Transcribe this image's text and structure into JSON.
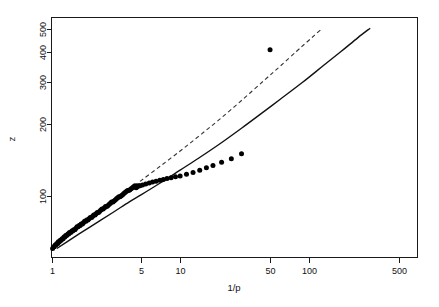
{
  "figure": {
    "background_color": "#ffffff",
    "foreground_color": "#111111",
    "width": 439,
    "height": 307
  },
  "axes": {
    "x_title": "1/p",
    "y_title": "z"
  },
  "chart_data": {
    "type": "scatter",
    "title": "",
    "subtitle": "",
    "xlabel": "1/p",
    "ylabel": "z",
    "xscale": "log",
    "yscale": "log",
    "grid": false,
    "legend": "none",
    "xlim": [
      1.0,
      700
    ],
    "ylim": [
      55,
      560
    ],
    "xticks": [
      1,
      5,
      10,
      50,
      100,
      500
    ],
    "xtick_labels": [
      "1",
      "5",
      "10",
      "50",
      "100",
      "500"
    ],
    "yticks": [
      100,
      200,
      300,
      400,
      500
    ],
    "ytick_labels": [
      "100",
      "200",
      "300",
      "400",
      "500"
    ],
    "series": [
      {
        "name": "observations",
        "type": "scatter",
        "marker": "filled-circle",
        "color": "#000000",
        "points": [
          [
            1.02,
            60
          ],
          [
            1.04,
            61
          ],
          [
            1.05,
            61
          ],
          [
            1.07,
            62
          ],
          [
            1.08,
            62
          ],
          [
            1.1,
            63
          ],
          [
            1.12,
            63
          ],
          [
            1.13,
            64
          ],
          [
            1.15,
            64
          ],
          [
            1.17,
            65
          ],
          [
            1.19,
            65
          ],
          [
            1.21,
            66
          ],
          [
            1.23,
            66
          ],
          [
            1.25,
            67
          ],
          [
            1.27,
            67
          ],
          [
            1.29,
            68
          ],
          [
            1.31,
            68
          ],
          [
            1.34,
            69
          ],
          [
            1.36,
            69
          ],
          [
            1.38,
            70
          ],
          [
            1.41,
            70
          ],
          [
            1.44,
            71
          ],
          [
            1.46,
            71
          ],
          [
            1.49,
            72
          ],
          [
            1.52,
            72
          ],
          [
            1.55,
            73
          ],
          [
            1.58,
            74
          ],
          [
            1.61,
            74
          ],
          [
            1.64,
            75
          ],
          [
            1.67,
            75
          ],
          [
            1.7,
            76
          ],
          [
            1.74,
            76
          ],
          [
            1.77,
            77
          ],
          [
            1.81,
            78
          ],
          [
            1.85,
            78
          ],
          [
            1.88,
            79
          ],
          [
            1.92,
            79
          ],
          [
            1.96,
            80
          ],
          [
            2.0,
            81
          ],
          [
            2.05,
            81
          ],
          [
            2.09,
            82
          ],
          [
            2.13,
            83
          ],
          [
            2.18,
            83
          ],
          [
            2.22,
            84
          ],
          [
            2.27,
            85
          ],
          [
            2.32,
            85
          ],
          [
            2.37,
            86
          ],
          [
            2.42,
            87
          ],
          [
            2.47,
            88
          ],
          [
            2.52,
            88
          ],
          [
            2.58,
            89
          ],
          [
            2.63,
            90
          ],
          [
            2.69,
            90
          ],
          [
            2.75,
            91
          ],
          [
            2.81,
            92
          ],
          [
            2.87,
            93
          ],
          [
            2.93,
            94
          ],
          [
            3.0,
            94
          ],
          [
            3.06,
            95
          ],
          [
            3.13,
            96
          ],
          [
            3.2,
            97
          ],
          [
            3.27,
            98
          ],
          [
            3.34,
            99
          ],
          [
            3.41,
            99
          ],
          [
            3.49,
            100
          ],
          [
            3.57,
            101
          ],
          [
            3.65,
            102
          ],
          [
            3.73,
            103
          ],
          [
            3.81,
            104
          ],
          [
            3.9,
            105
          ],
          [
            3.98,
            105
          ],
          [
            4.07,
            106
          ],
          [
            4.16,
            107
          ],
          [
            4.26,
            108
          ],
          [
            4.35,
            109
          ],
          [
            4.45,
            110
          ],
          [
            4.55,
            108
          ],
          [
            4.65,
            109
          ],
          [
            4.76,
            110
          ],
          [
            4.87,
            110
          ],
          [
            5.1,
            111
          ],
          [
            5.4,
            112
          ],
          [
            5.75,
            113
          ],
          [
            6.1,
            114
          ],
          [
            6.5,
            115
          ],
          [
            6.95,
            116
          ],
          [
            7.4,
            117
          ],
          [
            7.9,
            118
          ],
          [
            8.5,
            119
          ],
          [
            9.2,
            120
          ],
          [
            10.0,
            121
          ],
          [
            11.2,
            123
          ],
          [
            12.6,
            125
          ],
          [
            14.2,
            128
          ],
          [
            16.0,
            131
          ],
          [
            18.0,
            134
          ],
          [
            21.0,
            138
          ],
          [
            25.0,
            143
          ],
          [
            30.0,
            150
          ],
          [
            50.0,
            410
          ]
        ]
      },
      {
        "name": "fit-dashed",
        "type": "line",
        "style": "dashed",
        "color": "#333333",
        "points": [
          [
            1.1,
            62
          ],
          [
            1.5,
            71
          ],
          [
            2.0,
            80
          ],
          [
            3.0,
            94
          ],
          [
            4.0,
            106
          ],
          [
            5.0,
            116
          ],
          [
            7.0,
            133
          ],
          [
            10.0,
            154
          ],
          [
            14.0,
            178
          ],
          [
            20.0,
            208
          ],
          [
            30.0,
            251
          ],
          [
            45.0,
            305
          ],
          [
            60.0,
            350
          ],
          [
            80.0,
            403
          ],
          [
            95.0,
            438
          ],
          [
            110.0,
            470
          ],
          [
            125.0,
            500
          ]
        ]
      },
      {
        "name": "fit-solid",
        "type": "line",
        "style": "solid",
        "color": "#111111",
        "points": [
          [
            1.1,
            60
          ],
          [
            1.5,
            67
          ],
          [
            2.0,
            74
          ],
          [
            3.0,
            85
          ],
          [
            4.0,
            94
          ],
          [
            5.0,
            101
          ],
          [
            7.0,
            113
          ],
          [
            10.0,
            128
          ],
          [
            14.0,
            144
          ],
          [
            20.0,
            164
          ],
          [
            30.0,
            192
          ],
          [
            45.0,
            226
          ],
          [
            60.0,
            254
          ],
          [
            90.0,
            300
          ],
          [
            130.0,
            352
          ],
          [
            180.0,
            405
          ],
          [
            240.0,
            460
          ],
          [
            300.0,
            505
          ]
        ]
      }
    ]
  }
}
